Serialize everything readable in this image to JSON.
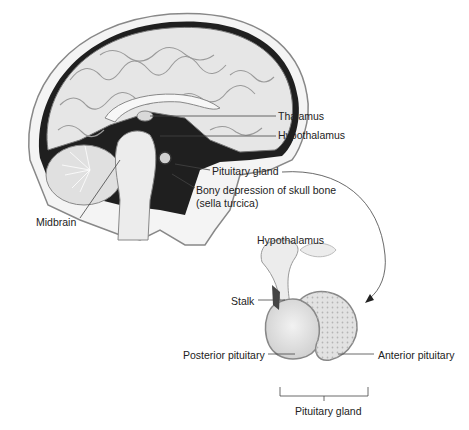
{
  "diagram": {
    "type": "anatomical-illustration"
  },
  "brain_labels": {
    "thalamus": "Thalamus",
    "hypothalamus": "Hypothalamus",
    "pituitary_gland": "Pituitary gland",
    "sella_line1": "Bony depression of skull bone",
    "sella_line2": "(sella turcica)",
    "midbrain": "Midbrain"
  },
  "detail_labels": {
    "hypothalamus": "Hypothalamus",
    "stalk": "Stalk",
    "posterior": "Posterior pituitary",
    "anterior": "Anterior pituitary",
    "gland": "Pituitary gland"
  },
  "colors": {
    "tissue": "#e9e9e9",
    "outline": "#555555",
    "dark": "#2a2a2a",
    "leader": "#444444"
  }
}
